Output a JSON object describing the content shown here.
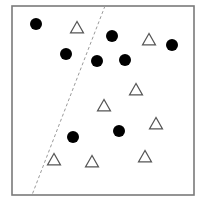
{
  "diagram": {
    "type": "scatter-classification",
    "frame": {
      "x": 12,
      "y": 6,
      "width": 182,
      "height": 189,
      "stroke": "#7a7a7a"
    },
    "decision_boundary": {
      "x1": 105,
      "y1": 6,
      "x2": 32,
      "y2": 195,
      "style": "dashed",
      "color": "#9a9a9a"
    },
    "classes": [
      {
        "name": "circle",
        "fill": "#000000"
      },
      {
        "name": "triangle",
        "stroke": "#555555"
      }
    ],
    "circles": [
      {
        "x": 36,
        "y": 24
      },
      {
        "x": 66,
        "y": 54
      },
      {
        "x": 112,
        "y": 36
      },
      {
        "x": 97,
        "y": 61
      },
      {
        "x": 125,
        "y": 60
      },
      {
        "x": 172,
        "y": 45
      },
      {
        "x": 73,
        "y": 137
      },
      {
        "x": 119,
        "y": 131
      }
    ],
    "triangles": [
      {
        "x": 77,
        "y": 28
      },
      {
        "x": 149,
        "y": 40
      },
      {
        "x": 136,
        "y": 90
      },
      {
        "x": 104,
        "y": 106
      },
      {
        "x": 156,
        "y": 124
      },
      {
        "x": 54,
        "y": 160
      },
      {
        "x": 92,
        "y": 162
      },
      {
        "x": 145,
        "y": 157
      }
    ]
  }
}
